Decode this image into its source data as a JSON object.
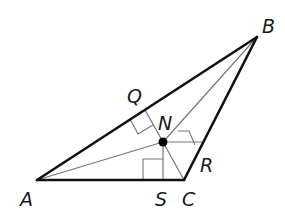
{
  "figure": {
    "vertices": [
      "A",
      "B",
      "C"
    ],
    "interior_point": "N",
    "feet_of_perpendiculars": [
      "Q",
      "R",
      "S"
    ],
    "labels": {
      "A": "A",
      "B": "B",
      "C": "C",
      "N": "N",
      "Q": "Q",
      "R": "R",
      "S": "S"
    },
    "right_angle_marks": [
      "Q",
      "R",
      "S"
    ],
    "colors": {
      "sides": "#111111",
      "inner_segments": "#777777",
      "point": "#000000"
    }
  }
}
